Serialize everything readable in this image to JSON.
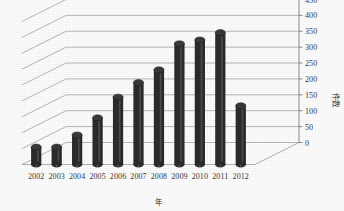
{
  "chart_data": {
    "type": "bar",
    "title": "",
    "subtitle": "",
    "xlabel": "年",
    "ylabel": "件数",
    "categories": [
      "2002",
      "2003",
      "2004",
      "2005",
      "2006",
      "2007",
      "2008",
      "2009",
      "2010",
      "2011",
      "2012"
    ],
    "values": [
      55,
      55,
      93,
      147,
      212,
      258,
      298,
      380,
      392,
      415,
      185
    ],
    "series": [
      {
        "name": "件数",
        "values": [
          55,
          55,
          93,
          147,
          212,
          258,
          298,
          380,
          392,
          415,
          185
        ]
      }
    ],
    "ylim": [
      0,
      450
    ],
    "ytick_labels": [
      "0",
      "50",
      "100",
      "150",
      "200",
      "250",
      "300",
      "350",
      "400",
      "450"
    ],
    "ytick_values": [
      0,
      50,
      100,
      150,
      200,
      250,
      300,
      350,
      400,
      450
    ],
    "y_axis_position": "right",
    "grid": true,
    "grid_axis": "y",
    "legend": false,
    "legend_position": "none",
    "style": "3d-cylinder",
    "bar_color": "#2b2b2b",
    "bar_highlight_color": "#6a6a6a",
    "grid_color": "#9a9a9a",
    "background_color": "#fdfdfd",
    "text_color": "#3a3a3a"
  }
}
